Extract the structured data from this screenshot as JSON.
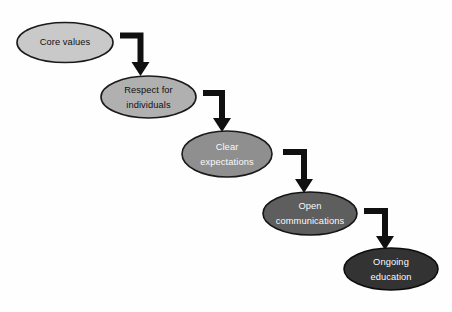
{
  "diagram": {
    "type": "cascade-flowchart",
    "orientation": "descending-staircase",
    "background_color": "#fefefe",
    "nodes": [
      {
        "id": "core-values",
        "label_line1": "Core values",
        "label_line2": "",
        "cx": 65,
        "cy": 42.5,
        "rx": 48,
        "ry": 20,
        "fill": "#c9c9c9",
        "stroke": "#1a1a1a",
        "text_color": "#111111"
      },
      {
        "id": "respect-for-individuals",
        "label_line1": "Respect for",
        "label_line2": "individuals",
        "cx": 148.5,
        "cy": 97,
        "rx": 47.5,
        "ry": 21,
        "fill": "#b0b0b0",
        "stroke": "#1a1a1a",
        "text_color": "#111111"
      },
      {
        "id": "clear-expectations",
        "label_line1": "Clear",
        "label_line2": "expectations",
        "cx": 227,
        "cy": 154,
        "rx": 45,
        "ry": 23,
        "fill": "#8f8f8f",
        "stroke": "#1a1a1a",
        "text_color": "#fafafa"
      },
      {
        "id": "open-communications",
        "label_line1": "Open",
        "label_line2": "communications",
        "cx": 310,
        "cy": 213.5,
        "rx": 47,
        "ry": 21.5,
        "fill": "#5e5e5e",
        "stroke": "#141414",
        "text_color": "#fafafa"
      },
      {
        "id": "ongoing-education",
        "label_line1": "Ongoing",
        "label_line2": "education",
        "cx": 391,
        "cy": 269,
        "rx": 47,
        "ry": 21,
        "fill": "#333333",
        "stroke": "#0d0d0d",
        "text_color": "#fafafa"
      }
    ],
    "connectors": [
      {
        "id": "arrow-core-values-to-respect",
        "from": "core-values",
        "to": "respect-for-individuals",
        "elbow_x": 120,
        "elbow_y": 35.5,
        "corner_x": 140.5,
        "tip_y": 74,
        "color": "#101010"
      },
      {
        "id": "arrow-respect-to-clear",
        "from": "respect-for-individuals",
        "to": "clear-expectations",
        "elbow_x": 203,
        "elbow_y": 93,
        "corner_x": 222,
        "tip_y": 130,
        "color": "#101010"
      },
      {
        "id": "arrow-clear-to-open",
        "from": "clear-expectations",
        "to": "open-communications",
        "elbow_x": 283,
        "elbow_y": 152,
        "corner_x": 304,
        "tip_y": 191,
        "color": "#101010"
      },
      {
        "id": "arrow-open-to-ongoing",
        "from": "open-communications",
        "to": "ongoing-education",
        "elbow_x": 364,
        "elbow_y": 211,
        "corner_x": 385,
        "tip_y": 248,
        "color": "#101010"
      }
    ]
  }
}
